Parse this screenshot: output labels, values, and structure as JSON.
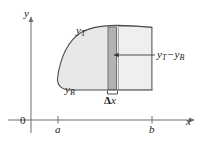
{
  "figure": {
    "axes": {
      "y_axis_label": "y",
      "x_axis_label": "x",
      "origin_label": "0",
      "tick_labels": [
        "a",
        "b"
      ]
    },
    "curve_labels": {
      "top": "y",
      "top_sub": "T",
      "bottom": "y",
      "bottom_sub": "B"
    },
    "annotations": {
      "height_label_lead": "y",
      "height_label_lead_sub": "T",
      "height_label_minus": "−",
      "height_label_trail": "y",
      "height_label_trail_sub": "B",
      "width_label_delta": "Δ",
      "width_label_var": "x"
    },
    "colors": {
      "region_fill": "#e8e8e8",
      "strip_fill": "#b3b3b3",
      "outline": "#4d4d4d",
      "axis": "#6e6e6e",
      "text": "#1a1a1a"
    },
    "geometry": {
      "x_axis_y": 120,
      "y_axis_x": 31,
      "tick_a_x": 58,
      "tick_b_x": 152,
      "strip_left_x": 108,
      "strip_right_x": 116,
      "region_top_y": 27,
      "region_bottom_y": 90
    }
  }
}
